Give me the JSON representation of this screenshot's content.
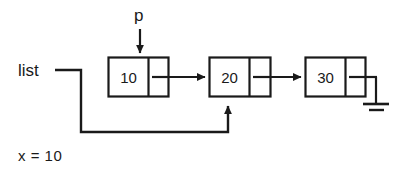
{
  "diagram": {
    "background_color": "#ffffff",
    "stroke_color": "#1a1a1a",
    "text_color": "#1a1a1a",
    "labels": {
      "head_pointer": "list",
      "node_pointer": "p",
      "variable_assignment": "x = 10"
    },
    "nodes": [
      {
        "id": "node-1",
        "value": "10",
        "next": "node-2"
      },
      {
        "id": "node-2",
        "value": "20",
        "next": "node-3"
      },
      {
        "id": "node-3",
        "value": "30",
        "next": "null"
      }
    ],
    "pointers": [
      {
        "name": "p",
        "points_to": "node-1",
        "direction": "down"
      },
      {
        "name": "list",
        "points_to": "node-2",
        "direction": "up"
      }
    ],
    "terminator": "ground-null-symbol"
  }
}
